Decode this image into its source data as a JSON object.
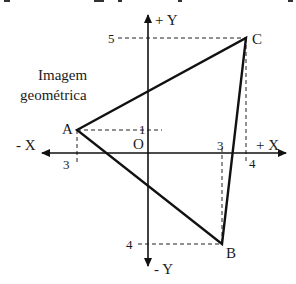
{
  "diagram": {
    "title_lines": [
      "Imagem",
      "geométrica"
    ],
    "axes": {
      "x_positive_label": "+ X",
      "x_negative_label": "- X",
      "y_positive_label": "+ Y",
      "y_negative_label": "- Y",
      "origin_label": "O"
    },
    "points": [
      {
        "name": "A",
        "label": "A",
        "x": -3,
        "y": 1
      },
      {
        "name": "B",
        "label": "B",
        "x": 3,
        "y": -4
      },
      {
        "name": "C",
        "label": "C",
        "x": 4,
        "y": 5
      }
    ],
    "ticks": {
      "x_neg_3": "3",
      "x_pos_3": "3",
      "x_pos_4": "4",
      "y_pos_1": "1",
      "y_pos_5": "5",
      "y_neg_4": "4"
    },
    "colors": {
      "line": "#111111",
      "dash": "#222222",
      "background": "#ffffff"
    }
  }
}
